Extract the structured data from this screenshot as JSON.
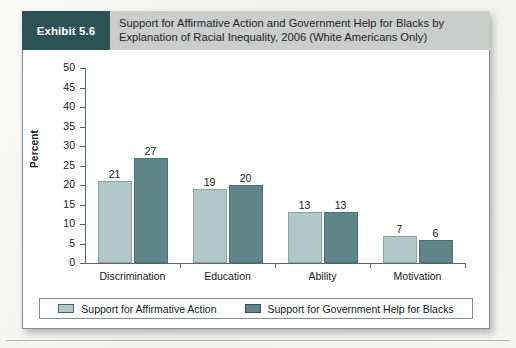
{
  "exhibit": {
    "badge_label": "Exhibit 5.6",
    "title_line1": "Support for Affirmative Action and Government Help for Blacks by",
    "title_line2": "Explanation of Racial Inequality, 2006 (White Americans Only)",
    "badge_bg": "#2b5356",
    "header_bg": "#cbcdcc"
  },
  "chart_data": {
    "type": "bar",
    "title": "Support for Affirmative Action and Government Help for Blacks by Explanation of Racial Inequality, 2006 (White Americans Only)",
    "xlabel": "",
    "ylabel": "Percent",
    "ylim": [
      0,
      50
    ],
    "ytick_step": 5,
    "yticks": [
      50,
      45,
      40,
      35,
      30,
      25,
      20,
      15,
      10,
      5,
      0
    ],
    "grid": false,
    "legend_position": "bottom",
    "categories": [
      "Discrimination",
      "Education",
      "Ability",
      "Motivation"
    ],
    "series": [
      {
        "name": "Support for Affirmative Action",
        "color": "#b2c7c7",
        "values": [
          21,
          19,
          13,
          7
        ]
      },
      {
        "name": "Support for Government Help for Blacks",
        "color": "#5e8688",
        "values": [
          27,
          20,
          13,
          6
        ]
      }
    ]
  }
}
